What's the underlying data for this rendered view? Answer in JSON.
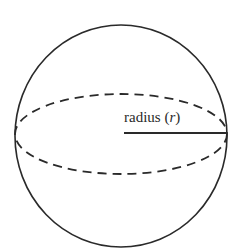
{
  "diagram": {
    "label": {
      "prefix": "radius (",
      "variable": "r",
      "suffix": ")"
    },
    "colors": {
      "stroke": "#2a2a2a",
      "background": "#ffffff"
    }
  }
}
